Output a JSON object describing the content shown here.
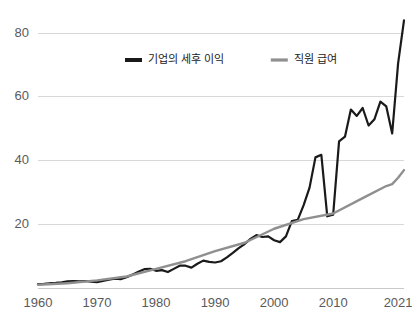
{
  "chart_data": {
    "type": "line",
    "title": "",
    "subtitle": "",
    "xlabel": "",
    "ylabel": "",
    "xlim": [
      1960,
      2022
    ],
    "ylim": [
      0,
      86
    ],
    "grid": "horizontal",
    "legend_position": "top-center",
    "y_ticks": [
      20,
      40,
      60,
      80
    ],
    "y_tick_labels": [
      "20",
      "40",
      "60",
      "80"
    ],
    "x_ticks": [
      1960,
      1970,
      1980,
      1990,
      2000,
      2010,
      2021
    ],
    "x_tick_labels": [
      "1960",
      "1970",
      "1980",
      "1990",
      "2000",
      "2010",
      "2021"
    ],
    "colors": {
      "series_corporate_profits": "#1a1a1a",
      "series_employee_wages": "#8f8f8f",
      "gridline": "#d8d8d8",
      "axis": "#c9c9c9",
      "tick_text": "#5a5a5a",
      "legend_text": "#222222",
      "background": "#ffffff"
    },
    "series": [
      {
        "name": "기업의 세후 이익",
        "color": "#1a1a1a",
        "width": 2.2,
        "x": [
          1960,
          1961,
          1962,
          1963,
          1964,
          1965,
          1966,
          1967,
          1968,
          1969,
          1970,
          1971,
          1972,
          1973,
          1974,
          1975,
          1976,
          1977,
          1978,
          1979,
          1980,
          1981,
          1982,
          1983,
          1984,
          1985,
          1986,
          1987,
          1988,
          1989,
          1990,
          1991,
          1992,
          1993,
          1994,
          1995,
          1996,
          1997,
          1998,
          1999,
          2000,
          2001,
          2002,
          2003,
          2004,
          2005,
          2006,
          2007,
          2008,
          2009,
          2010,
          2011,
          2012,
          2013,
          2014,
          2015,
          2016,
          2017,
          2018,
          2019,
          2020,
          2021,
          2022
        ],
        "values": [
          1.2,
          1.3,
          1.5,
          1.6,
          1.8,
          2.1,
          2.2,
          2.1,
          2.2,
          2.0,
          1.8,
          2.2,
          2.6,
          2.9,
          2.8,
          3.4,
          4.2,
          5.1,
          5.9,
          6.0,
          5.4,
          5.6,
          5.0,
          6.0,
          7.0,
          7.0,
          6.4,
          7.6,
          8.6,
          8.2,
          8.0,
          8.4,
          9.6,
          11.0,
          12.5,
          13.8,
          15.4,
          16.6,
          16.0,
          16.2,
          15.0,
          14.4,
          16.2,
          21.0,
          21.4,
          26.0,
          31.5,
          41.0,
          41.8,
          22.5,
          23.0,
          46.0,
          47.5,
          56.0,
          54.0,
          56.5,
          51.0,
          53.0,
          58.5,
          57.0,
          48.5,
          70.5,
          84.0
        ]
      },
      {
        "name": "직원 급여",
        "color": "#8f8f8f",
        "width": 2.4,
        "x": [
          1960,
          1965,
          1970,
          1975,
          1980,
          1985,
          1990,
          1995,
          2000,
          2005,
          2010,
          2015,
          2019,
          2020,
          2021,
          2022
        ],
        "values": [
          1.0,
          1.5,
          2.4,
          3.6,
          6.0,
          8.4,
          11.6,
          14.2,
          18.6,
          21.6,
          23.4,
          28.2,
          32.0,
          32.6,
          34.6,
          37.0
        ]
      }
    ]
  },
  "legend": {
    "items": [
      {
        "label": "기업의 세후 이익",
        "color": "#1a1a1a",
        "marker": "line-swatch-dark"
      },
      {
        "label": "직원 급여",
        "color": "#8f8f8f",
        "marker": "line-swatch-gray"
      }
    ]
  }
}
